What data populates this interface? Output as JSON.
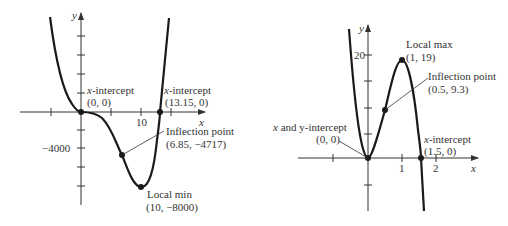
{
  "left_graph": {
    "axis_x_label": "x",
    "axis_y_label": "y",
    "x_tick_label": "10",
    "y_tick_label": "−4000",
    "annotations": {
      "origin": {
        "title_italic": "x",
        "title_rest": "-intercept",
        "coords": "(0, 0)"
      },
      "x_intercept": {
        "title_italic": "x",
        "title_rest": "-intercept",
        "coords": "(13.15, 0)"
      },
      "inflection": {
        "title": "Inflection point",
        "coords": "(6.85, −4717)"
      },
      "local_min": {
        "title": "Local min",
        "coords": "(10, −8000)"
      }
    }
  },
  "right_graph": {
    "axis_x_label": "x",
    "axis_y_label": "y",
    "x_tick_labels": [
      "1",
      "2"
    ],
    "y_tick_label": "20",
    "annotations": {
      "origin": {
        "title_italic": "x",
        "title_rest": " and y-intercept",
        "coords": "(0, 0)"
      },
      "local_max": {
        "title": "Local max",
        "coords": "(1, 19)"
      },
      "inflection": {
        "title": "Inflection point",
        "coords": "(0.5, 9.3)"
      },
      "x_intercept": {
        "title_italic": "x",
        "title_rest": "-intercept",
        "coords": "(1.5, 0)"
      }
    }
  },
  "colors": {
    "curve": "#1a1a1a",
    "axis": "#333333",
    "text": "#333333"
  }
}
